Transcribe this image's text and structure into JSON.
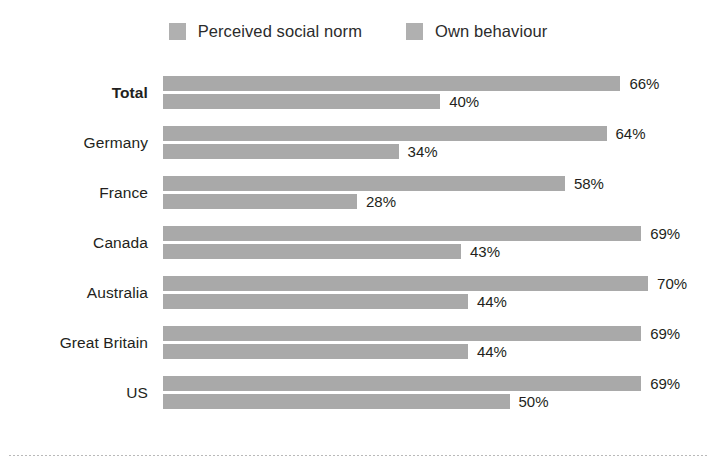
{
  "legend": {
    "items": [
      {
        "label": "Perceived social norm",
        "color": "#b0b0b0"
      },
      {
        "label": "Own behaviour",
        "color": "#b0b0b0"
      }
    ]
  },
  "chart_data": {
    "type": "bar",
    "orientation": "horizontal",
    "title": "",
    "subtitle": "",
    "xlabel": "",
    "ylabel": "",
    "xlim": [
      0,
      100
    ],
    "grid": false,
    "legend_position": "top-center",
    "value_suffix": "%",
    "categories": [
      "Total",
      "Germany",
      "France",
      "Canada",
      "Australia",
      "Great Britain",
      "US"
    ],
    "series": [
      {
        "name": "Perceived social norm",
        "color": "#a9a9a9",
        "values": [
          66,
          64,
          58,
          69,
          70,
          69,
          69
        ],
        "labels": [
          "66%",
          "64%",
          "58%",
          "69%",
          "70%",
          "69%",
          "69%"
        ]
      },
      {
        "name": "Own behaviour",
        "color": "#a9a9a9",
        "values": [
          40,
          34,
          28,
          43,
          44,
          44,
          50
        ],
        "labels": [
          "40%",
          "34%",
          "28%",
          "43%",
          "44%",
          "44%",
          "50%"
        ]
      }
    ],
    "emphasized_category": "Total"
  },
  "render": {
    "px_per_percent": 6.93
  }
}
